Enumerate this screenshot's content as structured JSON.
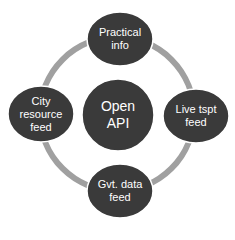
{
  "diagram": {
    "center": {
      "label_line1": "Open",
      "label_line2": "API"
    },
    "nodes": [
      {
        "id": "practical-info",
        "lines": [
          "Practical",
          "info"
        ]
      },
      {
        "id": "live-tspt-feed",
        "lines": [
          "Live tspt",
          "feed"
        ]
      },
      {
        "id": "gvt-data-feed",
        "lines": [
          "Gvt. data",
          "feed"
        ]
      },
      {
        "id": "city-resource-feed",
        "lines": [
          "City",
          "resource",
          "feed"
        ]
      }
    ],
    "colors": {
      "node_fill": "#3a3a3a",
      "node_border": "#ffffff",
      "ring": "#a0a0a0",
      "text": "#ffffff",
      "background": "#ffffff"
    }
  }
}
